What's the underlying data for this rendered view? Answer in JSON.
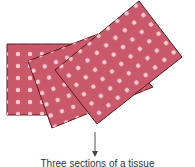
{
  "diagram": {
    "colors": {
      "sheet_fill": "#c9596a",
      "sheet_stroke": "#5a1a1e",
      "dot_fill": "#f4c9cf",
      "arrow": "#555555"
    },
    "sheets": [
      {
        "name": "back-sheet",
        "points": "7,44 82,44 82,115 7,115"
      },
      {
        "name": "middle-sheet",
        "points": "28,61 98,34 153,87 52,128"
      },
      {
        "name": "front-sheet",
        "points": "55,70 139,1 182,57 97,124"
      }
    ],
    "arrow": {
      "x": 95,
      "y1": 132,
      "y2": 156
    },
    "caption": "Three sections of a tissue"
  }
}
